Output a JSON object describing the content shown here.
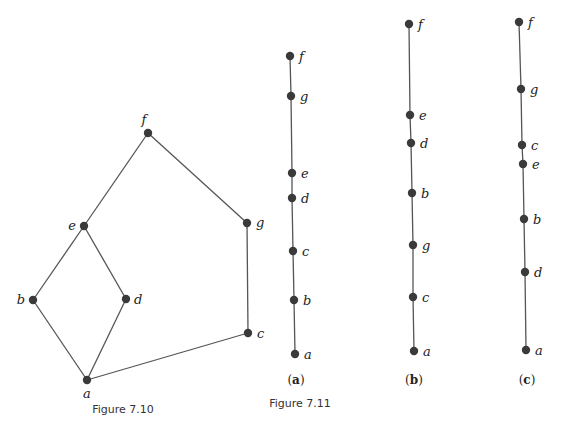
{
  "colors": {
    "node": "#3a3a3a",
    "edge": "#555555",
    "label": "#222222"
  },
  "figure_7_10": {
    "caption": "Figure 7.10",
    "nodes": [
      {
        "id": "f",
        "x": 148,
        "y": 133,
        "lx": 144,
        "ly": 124,
        "anchor": "middle"
      },
      {
        "id": "e",
        "x": 84,
        "y": 226,
        "lx": 76,
        "ly": 230,
        "anchor": "end"
      },
      {
        "id": "g",
        "x": 247,
        "y": 223,
        "lx": 256,
        "ly": 227,
        "anchor": "start"
      },
      {
        "id": "b",
        "x": 33,
        "y": 300,
        "lx": 25,
        "ly": 304,
        "anchor": "end"
      },
      {
        "id": "d",
        "x": 126,
        "y": 299,
        "lx": 134,
        "ly": 304,
        "anchor": "start"
      },
      {
        "id": "c",
        "x": 248,
        "y": 333,
        "lx": 257,
        "ly": 338,
        "anchor": "start"
      },
      {
        "id": "a",
        "x": 87,
        "y": 380,
        "lx": 87,
        "ly": 398,
        "anchor": "middle"
      }
    ],
    "edges": [
      [
        "a",
        "b"
      ],
      [
        "a",
        "d"
      ],
      [
        "b",
        "e"
      ],
      [
        "d",
        "e"
      ],
      [
        "e",
        "f"
      ],
      [
        "f",
        "g"
      ],
      [
        "g",
        "c"
      ],
      [
        "c",
        "a"
      ]
    ]
  },
  "figure_7_11": {
    "caption": "Figure 7.11",
    "chains": [
      {
        "label": "a",
        "label_x": 296,
        "nodes": [
          {
            "id": "f",
            "x": 290,
            "y": 56
          },
          {
            "id": "g",
            "x": 291,
            "y": 96
          },
          {
            "id": "e",
            "x": 292,
            "y": 173
          },
          {
            "id": "d",
            "x": 292,
            "y": 198
          },
          {
            "id": "c",
            "x": 293,
            "y": 251
          },
          {
            "id": "b",
            "x": 294,
            "y": 300
          },
          {
            "id": "a",
            "x": 295,
            "y": 354
          }
        ]
      },
      {
        "label": "b",
        "label_x": 414,
        "nodes": [
          {
            "id": "f",
            "x": 409,
            "y": 24
          },
          {
            "id": "e",
            "x": 410,
            "y": 115
          },
          {
            "id": "d",
            "x": 411,
            "y": 143
          },
          {
            "id": "b",
            "x": 412,
            "y": 193
          },
          {
            "id": "g",
            "x": 413,
            "y": 245
          },
          {
            "id": "c",
            "x": 413,
            "y": 297
          },
          {
            "id": "a",
            "x": 414,
            "y": 351
          }
        ]
      },
      {
        "label": "c",
        "label_x": 527,
        "nodes": [
          {
            "id": "f",
            "x": 519,
            "y": 22
          },
          {
            "id": "g",
            "x": 521,
            "y": 89
          },
          {
            "id": "c",
            "x": 522,
            "y": 145
          },
          {
            "id": "e",
            "x": 523,
            "y": 164
          },
          {
            "id": "b",
            "x": 524,
            "y": 219
          },
          {
            "id": "d",
            "x": 525,
            "y": 272
          },
          {
            "id": "a",
            "x": 526,
            "y": 350
          }
        ]
      }
    ]
  }
}
